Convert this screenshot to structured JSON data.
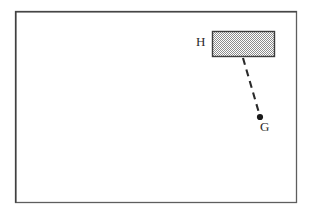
{
  "figure": {
    "background_color": "#ffffff",
    "canvas": {
      "width": 311,
      "height": 216
    },
    "frame": {
      "name": "outer-border-rectangle",
      "x": 15,
      "y": 11,
      "width": 282,
      "height": 192,
      "stroke_color": "#5a5a5a",
      "stroke_width": 1.3,
      "fill_color": "#ffffff"
    },
    "shapes": [
      {
        "name": "shaded-rectangle-H",
        "type": "rectangle",
        "label": "H",
        "x": 212,
        "y": 31,
        "width": 63,
        "height": 26,
        "fill_pattern": "checkerboard-stipple",
        "fill_color": "#a8a8a8",
        "stroke_color": "#3c3c3c",
        "stroke_width": 1.4
      },
      {
        "name": "point-G",
        "type": "point",
        "label": "G",
        "cx": 260,
        "cy": 117,
        "radius": 3.1,
        "fill_color": "#1a1a1a"
      },
      {
        "name": "dashed-connector",
        "type": "dashed-line",
        "x1": 243,
        "y1": 58,
        "x2": 259,
        "y2": 113,
        "stroke_color": "#2a2a2a",
        "stroke_width": 2.1,
        "dash_pattern": "7 5"
      }
    ],
    "labels": {
      "H": "H",
      "G": "G"
    }
  }
}
